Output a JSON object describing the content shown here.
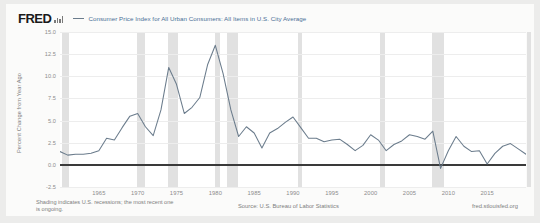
{
  "header": {
    "logo_text": "FRED",
    "logo_icon": "bar-chart-icon",
    "legend_label": "Consumer Price Index for All Urban Consumers: All Items in U.S. City Average",
    "series_color": "#6b7c8c"
  },
  "footer": {
    "shading_note": "Shading indicates U.S. recessions; the most recent one is ongoing.",
    "source_note": "Source: U.S. Bureau of Labor Statistics",
    "url_note": "fred.stlouisfed.org"
  },
  "chart_data": {
    "type": "line",
    "title": "",
    "xlabel": "",
    "ylabel": "Percent Change from Year Ago",
    "xlim": [
      1960,
      2020
    ],
    "ylim": [
      -2.5,
      15.0
    ],
    "yticks": [
      15.0,
      12.5,
      10.0,
      7.5,
      5.0,
      2.5,
      0.0,
      -2.5
    ],
    "ytick_labels": [
      "15.0",
      "12.5",
      "10.0",
      "7.5",
      "5.0",
      "2.5",
      "0.0",
      "-2.5"
    ],
    "xticks": [
      1965,
      1970,
      1975,
      1980,
      1985,
      1990,
      1995,
      2000,
      2005,
      2010,
      2015
    ],
    "xtick_labels": [
      "1965",
      "1970",
      "1975",
      "1980",
      "1985",
      "1990",
      "1995",
      "2000",
      "2005",
      "2010",
      "2015"
    ],
    "grid": true,
    "legend_position": "top",
    "zero_line": 0.0,
    "series": [
      {
        "name": "Consumer Price Index for All Urban Consumers: All Items in U.S. City Average",
        "color": "#6b7c8c",
        "x": [
          1960,
          1961,
          1962,
          1963,
          1964,
          1965,
          1966,
          1967,
          1968,
          1969,
          1970,
          1971,
          1972,
          1973,
          1974,
          1975,
          1976,
          1977,
          1978,
          1979,
          1980,
          1981,
          1982,
          1983,
          1984,
          1985,
          1986,
          1987,
          1988,
          1989,
          1990,
          1991,
          1992,
          1993,
          1994,
          1995,
          1996,
          1997,
          1998,
          1999,
          2000,
          2001,
          2002,
          2003,
          2004,
          2005,
          2006,
          2007,
          2008,
          2009,
          2010,
          2011,
          2012,
          2013,
          2014,
          2015,
          2016,
          2017,
          2018,
          2019,
          2020
        ],
        "values": [
          1.5,
          1.1,
          1.2,
          1.2,
          1.3,
          1.6,
          3.0,
          2.8,
          4.2,
          5.5,
          5.8,
          4.3,
          3.3,
          6.2,
          11.0,
          9.1,
          5.8,
          6.5,
          7.6,
          11.3,
          13.5,
          10.3,
          6.2,
          3.2,
          4.3,
          3.6,
          1.9,
          3.6,
          4.1,
          4.8,
          5.4,
          4.2,
          3.0,
          3.0,
          2.6,
          2.8,
          2.9,
          2.3,
          1.6,
          2.2,
          3.4,
          2.8,
          1.6,
          2.3,
          2.7,
          3.4,
          3.2,
          2.9,
          3.8,
          -0.4,
          1.6,
          3.2,
          2.1,
          1.5,
          1.6,
          0.1,
          1.3,
          2.1,
          2.4,
          1.8,
          1.2
        ]
      }
    ],
    "recessions": [
      {
        "start": 1960.3,
        "end": 1961.2
      },
      {
        "start": 1969.9,
        "end": 1970.9
      },
      {
        "start": 1973.9,
        "end": 1975.2
      },
      {
        "start": 1980.0,
        "end": 1980.6
      },
      {
        "start": 1981.5,
        "end": 1982.9
      },
      {
        "start": 1990.6,
        "end": 1991.2
      },
      {
        "start": 2001.2,
        "end": 2001.9
      },
      {
        "start": 2007.9,
        "end": 2009.5
      },
      {
        "start": 2020.1,
        "end": 2020.6
      }
    ]
  }
}
